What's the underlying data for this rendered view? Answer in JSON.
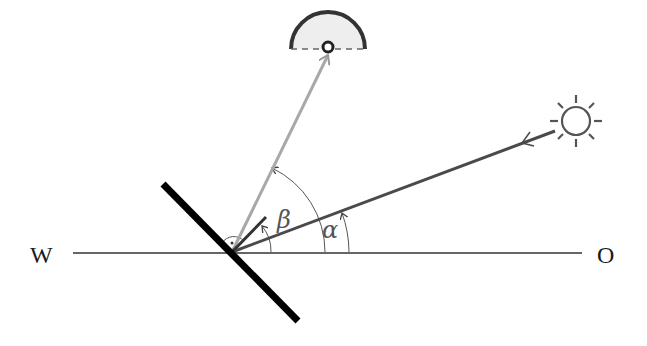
{
  "diagram": {
    "labels": {
      "west": "W",
      "east": "O",
      "angle_sun": "α",
      "angle_reflected": "β"
    },
    "elements": {
      "horizon_line": {
        "x1": 73,
        "y1": 253,
        "x2": 582,
        "y2": 253
      },
      "mirror": {
        "x1": 163,
        "y1": 184,
        "x2": 298,
        "y2": 321
      },
      "pivot": {
        "x": 232,
        "y": 252
      },
      "sun_ray": {
        "from": "sun",
        "to": "pivot"
      },
      "reflected_ray": {
        "from": "pivot",
        "to": "observer"
      },
      "mirror_normal": {
        "from": "pivot",
        "angle_description": "short normal to mirror"
      }
    },
    "icons": {
      "sun": "sun-icon",
      "observer": "observer-dome-icon"
    },
    "colors": {
      "mirror": "#000000",
      "sun_ray": "#4a4a4a",
      "reflected_ray": "#a8a8a8",
      "horizon": "#333333",
      "arcs": "#555555",
      "dome_fill": "#eeeeee"
    }
  }
}
